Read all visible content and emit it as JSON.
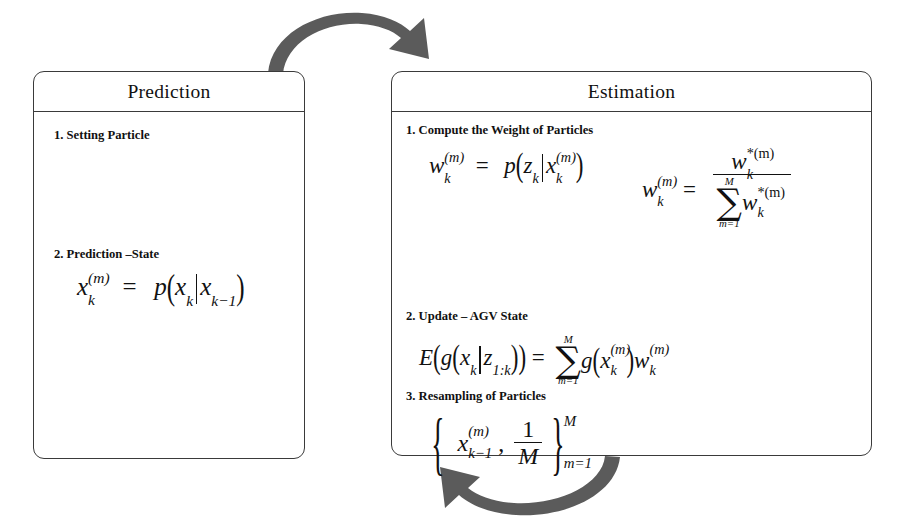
{
  "diagram": {
    "background_color": "#ffffff",
    "line_color": "#3a3a3a",
    "arrow_color": "#5b5b5b",
    "text_color": "#111111"
  },
  "prediction": {
    "title": "Prediction",
    "steps": [
      {
        "label": "1. Setting Particle",
        "formula_present": false
      },
      {
        "label": "2. Prediction –State",
        "formula_present": true,
        "formula_plain": "x_k^(m) = p( x_k | x_{k-1} )",
        "formula_parts": {
          "lhs_base": "x",
          "lhs_sub": "k",
          "lhs_sup": "(m)",
          "equals": "=",
          "fn": "p",
          "open": "(",
          "arg1_base": "x",
          "arg1_sub": "k",
          "bar": "|",
          "arg2_base": "x",
          "arg2_sub": "k−1",
          "close": ")"
        }
      }
    ]
  },
  "estimation": {
    "title": "Estimation",
    "steps": [
      {
        "label": "1. Compute the Weight of Particles",
        "formula_present": true,
        "formula_plain_left": "w_k^(m) = p( z_k | x_k^(m) )",
        "formula_plain_right": "w_k^(m) = w*_k^(m) / sum_{m=1}^{M} w*_k^(m)",
        "left_parts": {
          "lhs_base": "w",
          "lhs_sub": "k",
          "lhs_sup": "(m)",
          "equals": "=",
          "fn": "p",
          "open": "(",
          "arg1_base": "z",
          "arg1_sub": "k",
          "bar": "|",
          "arg2_base": "x",
          "arg2_sub": "k",
          "arg2_sup": "(m)",
          "close": ")"
        },
        "right_parts": {
          "lhs_base": "w",
          "lhs_sub": "k",
          "lhs_sup": "(m)",
          "equals": "=",
          "num_base": "w",
          "num_sub": "k",
          "num_sup": "*(m)",
          "sum_upper": "M",
          "sum_lower": "m=1",
          "den_base": "w",
          "den_sub": "k",
          "den_sup": "*(m)"
        }
      },
      {
        "label": "2. Update – AGV State",
        "formula_present": true,
        "formula_plain": "E( g( x_k | z_{1:k} ) ) = sum_{m=1}^{M} g( x_k^(m) ) w_k^(m)",
        "formula_parts": {
          "E": "E",
          "open1": "(",
          "g": "g",
          "open2": "(",
          "arg1_base": "x",
          "arg1_sub": "k",
          "bar": "|",
          "arg2_base": "z",
          "arg2_sub": "1:k",
          "close2": ")",
          "close1": ")",
          "equals": "=",
          "sum_upper": "M",
          "sum_lower": "m=1",
          "g2": "g",
          "open3": "(",
          "term_base": "x",
          "term_sub": "k",
          "term_sup": "(m)",
          "close3": ")",
          "w_base": "w",
          "w_sub": "k",
          "w_sup": "(m)"
        }
      },
      {
        "label": "3. Resampling of Particles",
        "formula_present": true,
        "formula_plain": "{ x_{k-1}^(m) , 1/M }_{m=1}^{M}",
        "formula_parts": {
          "open_brace": "{",
          "x_base": "x",
          "x_sub": "k−1",
          "x_sup": "(m)",
          "comma": ",",
          "frac_num": "1",
          "frac_den": "M",
          "close_brace": "}",
          "brace_sup": "M",
          "brace_sub": "m=1"
        }
      }
    ]
  },
  "arrows": [
    {
      "name": "prediction-to-estimation",
      "label": "",
      "direction": "right",
      "position": "top"
    },
    {
      "name": "estimation-to-prediction",
      "label": "",
      "direction": "left",
      "position": "bottom"
    }
  ]
}
